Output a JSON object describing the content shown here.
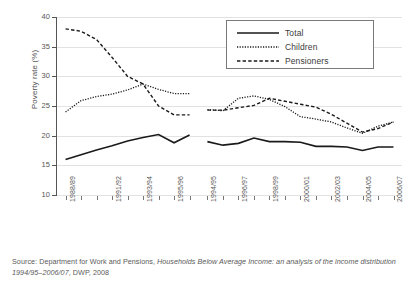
{
  "chart_data": {
    "type": "line",
    "title": "",
    "xlabel": "",
    "ylabel": "Poverty rate (%)",
    "ylim": [
      10,
      40
    ],
    "yticks": [
      10,
      15,
      20,
      25,
      30,
      35,
      40
    ],
    "grid": true,
    "legend_position": "top-right",
    "panels": [
      {
        "name": "panel-1",
        "categories": [
          "1988/89",
          "1989/90",
          "1990/91",
          "1991/92",
          "1992/93",
          "1993/94",
          "1994/95",
          "1995/96",
          "1996/97"
        ],
        "tick_labels": [
          "1988/89",
          "",
          "",
          "1991/92",
          "",
          "1993/94",
          "",
          "1995/96",
          ""
        ],
        "series": [
          {
            "name": "Total",
            "values": [
              16.0,
              16.8,
              17.6,
              18.3,
              19.1,
              19.7,
              20.2,
              18.8,
              20.1
            ]
          },
          {
            "name": "Children",
            "values": [
              24.0,
              25.9,
              26.6,
              27.0,
              27.7,
              28.7,
              27.8,
              27.1,
              27.1
            ]
          },
          {
            "name": "Pensioners",
            "values": [
              38.0,
              37.6,
              36.2,
              33.2,
              30.0,
              28.7,
              25.0,
              23.5,
              23.5
            ]
          }
        ]
      },
      {
        "name": "panel-2",
        "categories": [
          "1994/95",
          "1995/96",
          "1996/97",
          "1997/98",
          "1998/99",
          "1999/00",
          "2000/01",
          "2001/02",
          "2002/03",
          "2003/04",
          "2004/05",
          "2005/06",
          "2006/07"
        ],
        "tick_labels": [
          "1994/95",
          "",
          "1996/97",
          "",
          "1998/99",
          "",
          "2000/01",
          "",
          "2002/03",
          "",
          "2004/05",
          "",
          "2006/07"
        ],
        "series": [
          {
            "name": "Total",
            "values": [
              19.0,
              18.4,
              18.7,
              19.6,
              19.0,
              19.0,
              18.9,
              18.2,
              18.2,
              18.1,
              17.5,
              18.1,
              18.1
            ]
          },
          {
            "name": "Children",
            "values": [
              24.4,
              24.2,
              26.3,
              26.7,
              26.1,
              24.9,
              23.2,
              22.8,
              22.3,
              21.3,
              20.4,
              21.6,
              22.3
            ]
          },
          {
            "name": "Pensioners",
            "values": [
              24.3,
              24.3,
              24.7,
              25.1,
              26.3,
              25.8,
              25.3,
              24.8,
              23.6,
              22.1,
              20.6,
              21.2,
              22.3
            ]
          }
        ]
      }
    ]
  },
  "legend": {
    "items": [
      {
        "label": "Total",
        "style": "solid"
      },
      {
        "label": "Children",
        "style": "dotted"
      },
      {
        "label": "Pensioners",
        "style": "dashed"
      }
    ]
  },
  "axis": {
    "y_label": "Poverty rate (%)",
    "y_ticks": [
      "40",
      "35",
      "30",
      "25",
      "20",
      "15",
      "10"
    ]
  },
  "source": {
    "line1_prefix": "Source: Department for Work and Pensions, ",
    "line1_italic": "Households Below Average Income: an analysis of the income",
    "line2_italic": "distribution 1994/95–2006/07",
    "line2_suffix": ", DWP, 2008"
  }
}
